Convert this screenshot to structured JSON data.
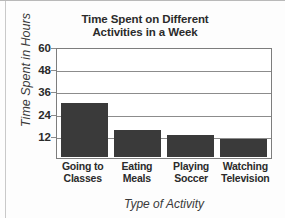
{
  "chart_data": {
    "type": "bar",
    "title": "Time Spent on Different Activities in a Week",
    "title_line1": "Time Spent on Different",
    "title_line2": "Activities in a Week",
    "xlabel": "Type of Activity",
    "ylabel": "Time Spent in Hours",
    "categories": [
      "Going to Classes",
      "Eating Meals",
      "Playing Soccer",
      "Watching Television"
    ],
    "category_lines": [
      [
        "Going to",
        "Classes"
      ],
      [
        "Eating",
        "Meals"
      ],
      [
        "Playing",
        "Soccer"
      ],
      [
        "Watching",
        "Television"
      ]
    ],
    "values": [
      30,
      15,
      12,
      10
    ],
    "ylim": [
      0,
      60
    ],
    "yticks": [
      12,
      24,
      36,
      48,
      60
    ],
    "ytick_labels": [
      "12",
      "24",
      "36",
      "48",
      "60"
    ],
    "grid": true,
    "legend": false,
    "bar_color": "#3a3a3a",
    "gridline_color": "#8c8c8c",
    "axis_color": "#7d7d7d",
    "background": "#ffffff"
  }
}
